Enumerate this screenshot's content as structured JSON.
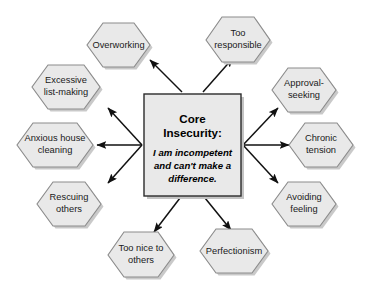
{
  "diagram": {
    "type": "radial-hub-and-spoke",
    "background_color": "#ffffff",
    "node_fill_color": "#e9e9e9",
    "node_stroke_color": "#8b8b8b",
    "arrow_color": "#111111",
    "center": {
      "shape": "rectangle",
      "title": "Core",
      "title_line2": "Insecurity:",
      "subtitle_line1": "I am incompetent",
      "subtitle_line2": "and can't make a",
      "subtitle_line3": "difference."
    },
    "nodes": [
      {
        "id": "overworking",
        "shape": "hexagon",
        "line1": "Overworking",
        "line2": ""
      },
      {
        "id": "too-responsible",
        "shape": "hexagon",
        "line1": "Too",
        "line2": "responsible"
      },
      {
        "id": "approval-seeking",
        "shape": "hexagon",
        "line1": "Approval-",
        "line2": "seeking"
      },
      {
        "id": "chronic-tension",
        "shape": "hexagon",
        "line1": "Chronic",
        "line2": "tension"
      },
      {
        "id": "avoiding-feeling",
        "shape": "hexagon",
        "line1": "Avoiding",
        "line2": "feeling"
      },
      {
        "id": "perfectionism",
        "shape": "hexagon",
        "line1": "Perfectionism",
        "line2": ""
      },
      {
        "id": "too-nice-to-others",
        "shape": "hexagon",
        "line1": "Too nice to",
        "line2": "others"
      },
      {
        "id": "rescuing-others",
        "shape": "hexagon",
        "line1": "Rescuing",
        "line2": "others"
      },
      {
        "id": "anxious-house-cleaning",
        "shape": "hexagon",
        "line1": "Anxious house",
        "line2": "cleaning"
      },
      {
        "id": "excessive-list-making",
        "shape": "hexagon",
        "line1": "Excessive",
        "line2": "list-making"
      }
    ]
  }
}
